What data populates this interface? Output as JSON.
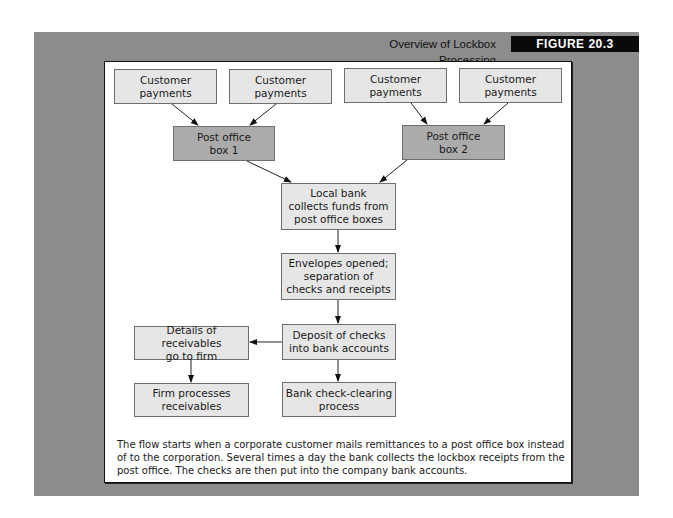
{
  "figure": {
    "title": "Overview of Lockbox Processing",
    "label": "FIGURE 20.3"
  },
  "nodes": {
    "cust1": "Customer\npayments",
    "cust2": "Customer\npayments",
    "cust3": "Customer\npayments",
    "cust4": "Customer\npayments",
    "pobox1": "Post office\nbox 1",
    "pobox2": "Post office\nbox 2",
    "local_bank": "Local bank\ncollects funds from\npost office boxes",
    "envelopes": "Envelopes opened;\nseparation of\nchecks and receipts",
    "deposit": "Deposit of checks\ninto bank accounts",
    "details": "Details of receivables\ngo to firm",
    "firm_processes": "Firm processes\nreceivables",
    "check_clearing": "Bank check-clearing\nprocess"
  },
  "edges": [
    [
      "cust1",
      "pobox1"
    ],
    [
      "cust2",
      "pobox1"
    ],
    [
      "cust3",
      "pobox2"
    ],
    [
      "cust4",
      "pobox2"
    ],
    [
      "pobox1",
      "local_bank"
    ],
    [
      "pobox2",
      "local_bank"
    ],
    [
      "local_bank",
      "envelopes"
    ],
    [
      "envelopes",
      "deposit"
    ],
    [
      "deposit",
      "details"
    ],
    [
      "deposit",
      "check_clearing"
    ],
    [
      "details",
      "firm_processes"
    ]
  ],
  "caption": "The flow starts when a corporate customer mails remittances to a post office box instead of to the corporation. Several times a day the bank collects the lockbox receipts from the post office. The checks are then put into the company bank accounts."
}
